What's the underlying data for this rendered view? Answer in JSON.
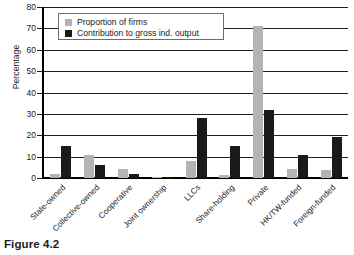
{
  "figure": {
    "caption": "Figure 4.2"
  },
  "chart_data": {
    "type": "bar",
    "title": "",
    "xlabel": "",
    "ylabel": "Percentage",
    "ylim": [
      0,
      80
    ],
    "yticks": [
      0,
      10,
      20,
      30,
      40,
      50,
      60,
      70,
      80
    ],
    "ytick_labels": [
      "0",
      "10",
      "20",
      "30",
      "40",
      "50",
      "60",
      "70",
      "80"
    ],
    "grid": true,
    "legend_position": "upper-left-inside",
    "categories": [
      "State-owned",
      "Collective-owned",
      "Cooperative",
      "Joint ownership",
      "LLCs",
      "Share-holding",
      "Private",
      "HK/TW-funded",
      "Foreign-funded"
    ],
    "series": [
      {
        "name": "Proportion of firms",
        "color": "#b4b4b4",
        "values": [
          1.7,
          11.0,
          4.0,
          0.4,
          8.0,
          1.5,
          71.0,
          4.0,
          3.8
        ]
      },
      {
        "name": "Contribution to gross ind. output",
        "color": "#1a1a1a",
        "values": [
          14.9,
          6.1,
          2.1,
          0.5,
          28.2,
          15.1,
          32.0,
          11.0,
          19.4
        ]
      }
    ]
  }
}
